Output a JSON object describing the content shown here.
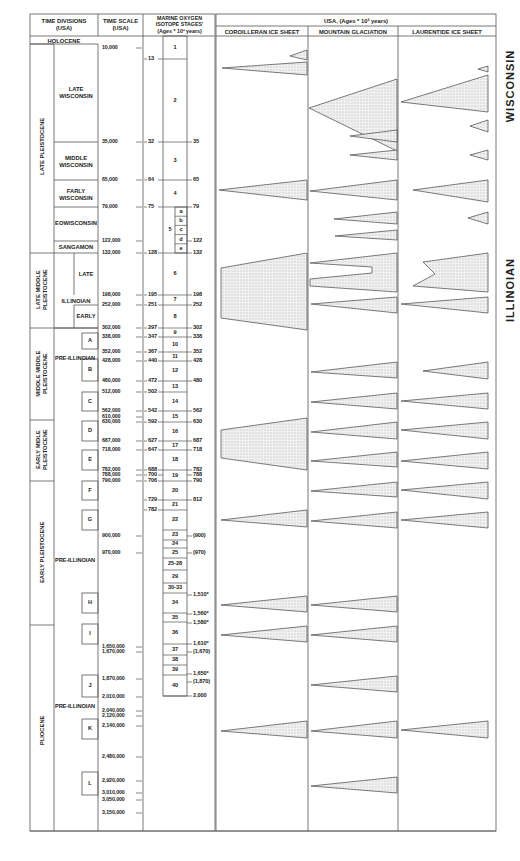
{
  "headers": {
    "time_divisions": "TIME DIVISIONS\n(USA)",
    "time_scale": "TIME SCALE\n(USA)",
    "isotope": "MARINE OXYGEN\nISOTOPE STAGES'\n(Ages * 10³ years)",
    "usa": "USA, (Ages * 10³ years)",
    "cordilleran": "COROILLERAN ICE SHEET",
    "mountain": "MOUNTAIN GLACIATION",
    "laurentide": "LAURENTIDE ICE SHEET"
  },
  "epochs": {
    "holocene": "HOLOCENE",
    "late_pleistocene": "LATE PLEISTOCENE",
    "late_middle_pleistocene": "LATE MIDDLE\nPLEISTOCENE",
    "middle_middle_pleistocene": "MIDDLE MIDDLE\nPLEISTOCENE",
    "early_middle_pleistocene": "EARLY MIDLE\nPLEISTOCENE",
    "early_pleistocene": "EARLY PLEISTOCENE",
    "pliocene": "PLIOCENE"
  },
  "divisions": {
    "late_wisconsin": "LATE\nWISCONSIN",
    "middle_wisconsin": "MIDDLE\nWISCONSIN",
    "early_wisconsin": "FARLY\nWISCONSIN",
    "eowisconsin": "EOWISCONSIN",
    "sangamon": "SANGAMON",
    "illinoian": "ILLINOIAN",
    "illinoian_late": "LATE",
    "illinoian_early": "EARLY",
    "pre_illinoian_1": "PRE-ILLINOIAN",
    "pre_illinoian_2": "PRE-ILLINOIAN",
    "pre_illinoian_3": "PRE-ILLINOIAN",
    "boxes": [
      "A",
      "B",
      "C",
      "D",
      "E",
      "F",
      "G",
      "H",
      "I",
      "J",
      "K",
      "L"
    ]
  },
  "time_scale": [
    {
      "label": "10,000",
      "y": 48
    },
    {
      "label": "35,000",
      "y": 142
    },
    {
      "label": "65,000",
      "y": 180
    },
    {
      "label": "79,000",
      "y": 207
    },
    {
      "label": "122,000",
      "y": 241
    },
    {
      "label": "132,000",
      "y": 253
    },
    {
      "label": "198,000",
      "y": 295
    },
    {
      "label": "252,000",
      "y": 305
    },
    {
      "label": "302,000",
      "y": 328
    },
    {
      "label": "338,000",
      "y": 337
    },
    {
      "label": "352,000",
      "y": 352
    },
    {
      "label": "428,000",
      "y": 361
    },
    {
      "label": "480,000",
      "y": 381
    },
    {
      "label": "512,000",
      "y": 392
    },
    {
      "label": "562,000",
      "y": 411
    },
    {
      "label": "610,000",
      "y": 417
    },
    {
      "label": "630,000",
      "y": 422
    },
    {
      "label": "687,000",
      "y": 441
    },
    {
      "label": "718,000",
      "y": 450
    },
    {
      "label": "782,000",
      "y": 470
    },
    {
      "label": "788,000",
      "y": 475
    },
    {
      "label": "790,000",
      "y": 481
    },
    {
      "label": "900,000",
      "y": 536
    },
    {
      "label": "970,000",
      "y": 553
    },
    {
      "label": "1,650,000",
      "y": 647
    },
    {
      "label": "1,670,000",
      "y": 652
    },
    {
      "label": "1,870,000",
      "y": 679
    },
    {
      "label": "2,010,000",
      "y": 697
    },
    {
      "label": "2,040,000",
      "y": 711
    },
    {
      "label": "2,120,000",
      "y": 716
    },
    {
      "label": "2,140,000",
      "y": 726
    },
    {
      "label": "2,480,000",
      "y": 757
    },
    {
      "label": "2,920,000",
      "y": 781
    },
    {
      "label": "3,010,000",
      "y": 793
    },
    {
      "label": "3,050,000",
      "y": 800
    },
    {
      "label": "3,150,000",
      "y": 813
    }
  ],
  "isotope_left": [
    {
      "label": "13",
      "y": 59
    },
    {
      "label": "32",
      "y": 142
    },
    {
      "label": "64",
      "y": 180
    },
    {
      "label": "75",
      "y": 207
    },
    {
      "label": "128",
      "y": 253
    },
    {
      "label": "195",
      "y": 295
    },
    {
      "label": "251",
      "y": 305
    },
    {
      "label": "297",
      "y": 328
    },
    {
      "label": "347",
      "y": 337
    },
    {
      "label": "367",
      "y": 352
    },
    {
      "label": "440",
      "y": 361
    },
    {
      "label": "472",
      "y": 381
    },
    {
      "label": "502",
      "y": 392
    },
    {
      "label": "542",
      "y": 411
    },
    {
      "label": "592",
      "y": 422
    },
    {
      "label": "627",
      "y": 441
    },
    {
      "label": "647",
      "y": 450
    },
    {
      "label": "688",
      "y": 470
    },
    {
      "label": "700",
      "y": 475
    },
    {
      "label": "706",
      "y": 481
    },
    {
      "label": "729",
      "y": 500
    },
    {
      "label": "782",
      "y": 510
    }
  ],
  "isotope_right": [
    {
      "label": "35",
      "y": 142
    },
    {
      "label": "65",
      "y": 180
    },
    {
      "label": "79",
      "y": 207
    },
    {
      "label": "122",
      "y": 241
    },
    {
      "label": "132",
      "y": 253
    },
    {
      "label": "198",
      "y": 295
    },
    {
      "label": "252",
      "y": 305
    },
    {
      "label": "302",
      "y": 328
    },
    {
      "label": "338",
      "y": 337
    },
    {
      "label": "352",
      "y": 352
    },
    {
      "label": "428",
      "y": 361
    },
    {
      "label": "480",
      "y": 381
    },
    {
      "label": "562",
      "y": 411
    },
    {
      "label": "630",
      "y": 422
    },
    {
      "label": "687",
      "y": 441
    },
    {
      "label": "718",
      "y": 450
    },
    {
      "label": "782",
      "y": 470
    },
    {
      "label": "788",
      "y": 475
    },
    {
      "label": "790",
      "y": 481
    },
    {
      "label": "812",
      "y": 500
    },
    {
      "label": "(900)",
      "y": 536
    },
    {
      "label": "(970)",
      "y": 553
    },
    {
      "label": "1,510*",
      "y": 595
    },
    {
      "label": "1,560*",
      "y": 614
    },
    {
      "label": "1,580*",
      "y": 623
    },
    {
      "label": "1,610*",
      "y": 644
    },
    {
      "label": "(1,670)",
      "y": 652
    },
    {
      "label": "1,650*",
      "y": 674
    },
    {
      "label": "(1,870)",
      "y": 682
    },
    {
      "label": "2,000",
      "y": 696
    }
  ],
  "stages": [
    {
      "label": "1",
      "top": 36,
      "bottom": 59
    },
    {
      "label": "2",
      "top": 59,
      "bottom": 142
    },
    {
      "label": "3",
      "top": 142,
      "bottom": 180
    },
    {
      "label": "4",
      "top": 180,
      "bottom": 207
    },
    {
      "label": "5",
      "top": 207,
      "bottom": 253
    },
    {
      "label": "6",
      "top": 253,
      "bottom": 295
    },
    {
      "label": "7",
      "top": 295,
      "bottom": 305
    },
    {
      "label": "8",
      "top": 305,
      "bottom": 328
    },
    {
      "label": "9",
      "top": 328,
      "bottom": 337
    },
    {
      "label": "10",
      "top": 337,
      "bottom": 352
    },
    {
      "label": "11",
      "top": 352,
      "bottom": 361
    },
    {
      "label": "12",
      "top": 361,
      "bottom": 381
    },
    {
      "label": "13",
      "top": 381,
      "bottom": 392
    },
    {
      "label": "14",
      "top": 392,
      "bottom": 411
    },
    {
      "label": "15",
      "top": 411,
      "bottom": 422
    },
    {
      "label": "16",
      "top": 422,
      "bottom": 441
    },
    {
      "label": "17",
      "top": 441,
      "bottom": 450
    },
    {
      "label": "18",
      "top": 450,
      "bottom": 470
    },
    {
      "label": "19",
      "top": 470,
      "bottom": 481
    },
    {
      "label": "20",
      "top": 481,
      "bottom": 500
    },
    {
      "label": "21",
      "top": 500,
      "bottom": 510
    },
    {
      "label": "22",
      "top": 510,
      "bottom": 530
    },
    {
      "label": "23",
      "top": 530,
      "bottom": 540
    },
    {
      "label": "24",
      "top": 540,
      "bottom": 548
    },
    {
      "label": "25",
      "top": 548,
      "bottom": 558
    },
    {
      "label": "25-28",
      "top": 558,
      "bottom": 570
    },
    {
      "label": "29",
      "top": 570,
      "bottom": 583
    },
    {
      "label": "30-33",
      "top": 583,
      "bottom": 593
    },
    {
      "label": "34",
      "top": 593,
      "bottom": 613
    },
    {
      "label": "35",
      "top": 613,
      "bottom": 622
    },
    {
      "label": "36",
      "top": 622,
      "bottom": 644
    },
    {
      "label": "37",
      "top": 644,
      "bottom": 655
    },
    {
      "label": "38",
      "top": 655,
      "bottom": 665
    },
    {
      "label": "39",
      "top": 665,
      "bottom": 675
    },
    {
      "label": "40",
      "top": 675,
      "bottom": 696
    }
  ],
  "substages": [
    "a",
    "b",
    "c",
    "d",
    "e"
  ],
  "side_labels": {
    "wisconsin": "WISCONSIN",
    "illinoian": "ILLINOIAN"
  }
}
